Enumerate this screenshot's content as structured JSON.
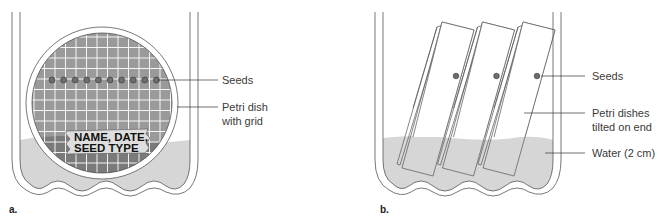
{
  "panels": [
    {
      "id": "a",
      "panel_label": "a.",
      "seed_count": 10,
      "dish_tag_lines": [
        "NAME, DATE,",
        "SEED TYPE"
      ],
      "callouts": {
        "seeds": "Seeds",
        "petri_dish_line1": "Petri dish",
        "petri_dish_line2": "with grid"
      }
    },
    {
      "id": "b",
      "panel_label": "b.",
      "dish_count": 3,
      "callouts": {
        "seeds": "Seeds",
        "petri_dishes_line1": "Petri dishes",
        "petri_dishes_line2": "tilted on end",
        "water": "Water (2 cm)"
      }
    }
  ],
  "colors": {
    "water": "#d6d6d6",
    "dish_grid_bg": "#9a9a9a",
    "dish_grid_below_water": "#7a7a7a",
    "grid_line": "#ffffff",
    "seed": "#6e6e6e",
    "outline": "#555555"
  }
}
